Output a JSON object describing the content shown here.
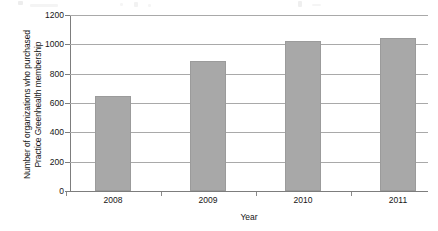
{
  "chart_data": {
    "type": "bar",
    "title": "",
    "subtitle": "",
    "xlabel": "Year",
    "ylabel": "Number of organizations who purchased Practice Greenhealth membership",
    "ylabel_lines": [
      "Number of organizations who purchased",
      "Practice Greenhealth membership"
    ],
    "categories": [
      "2008",
      "2009",
      "2010",
      "2011"
    ],
    "values": [
      648,
      887,
      1024,
      1044
    ],
    "ylim": [
      0,
      1200
    ],
    "ytick_labels": [
      "0",
      "200",
      "400",
      "600",
      "800",
      "1000",
      "1200"
    ],
    "ytick_values": [
      0,
      200,
      400,
      600,
      800,
      1000,
      1200
    ],
    "grid": "horizontal",
    "legend": "none",
    "bar_color": "#a8a8a8",
    "bar_border_color": "#9b9b9b",
    "gridline_color": "#a9a9a9",
    "axis_color": "#7d7d7d",
    "text_color": "#161616"
  }
}
